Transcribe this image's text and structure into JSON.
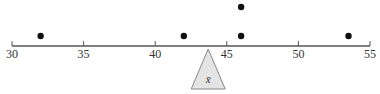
{
  "diagram": {
    "type": "dot plot with balance point",
    "axis": {
      "min": 30,
      "max": 55,
      "ticks": [
        30,
        35,
        40,
        45,
        50,
        55
      ],
      "tick_labels": [
        "30",
        "35",
        "40",
        "45",
        "50",
        "55"
      ]
    },
    "points": [
      {
        "value": 32,
        "stack": 1
      },
      {
        "value": 42,
        "stack": 1
      },
      {
        "value": 46,
        "stack": 1
      },
      {
        "value": 46,
        "stack": 2
      },
      {
        "value": 53.5,
        "stack": 1
      }
    ],
    "fulcrum": {
      "value": 43.7,
      "label": "x̄",
      "fill": "#e4e4e4",
      "stroke": "#888888"
    },
    "colors": {
      "axis": "#555555",
      "dot": "#111111"
    }
  }
}
